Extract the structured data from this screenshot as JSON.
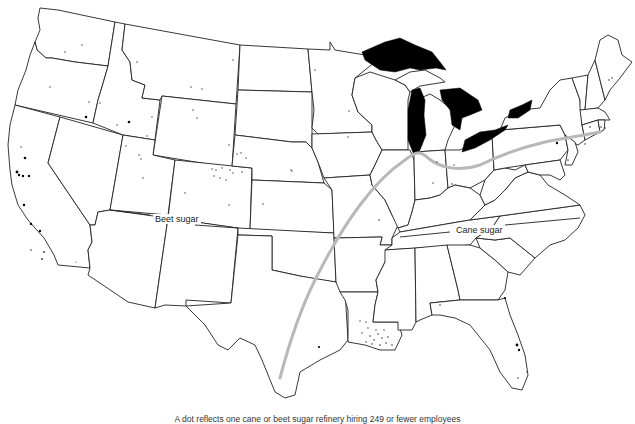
{
  "map": {
    "title": "US sugar refineries: beet sugar vs. cane sugar regions",
    "regions": {
      "beet": {
        "label": "Beet sugar"
      },
      "cane": {
        "label": "Cane sugar"
      }
    },
    "caption": "A dot reflects one cane or beet sugar refinery hiring 249 or fewer employees",
    "colors": {
      "state_fill": "#ffffff",
      "state_border": "#222222",
      "great_lakes": "#000000",
      "divider_line": "#b8b8b8",
      "refinery_dot": "#000000"
    },
    "legend": {
      "dot_meaning": "refinery"
    }
  }
}
